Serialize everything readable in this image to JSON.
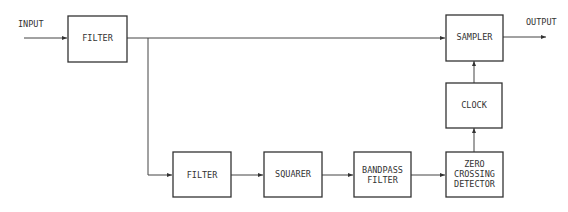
{
  "diagram": {
    "input_label": "INPUT",
    "output_label": "OUTPUT",
    "blocks": {
      "filter1": {
        "lines": [
          "FILTER"
        ]
      },
      "sampler": {
        "lines": [
          "SAMPLER"
        ]
      },
      "clock": {
        "lines": [
          "CLOCK"
        ]
      },
      "filter2": {
        "lines": [
          "FILTER"
        ]
      },
      "squarer": {
        "lines": [
          "SQUARER"
        ]
      },
      "bandpass": {
        "lines": [
          "BANDPASS",
          "FILTER"
        ]
      },
      "zcd": {
        "lines": [
          "ZERO",
          "CROSSING",
          "DETECTOR"
        ]
      }
    },
    "connections": [
      {
        "from": "input",
        "to": "filter1"
      },
      {
        "from": "filter1",
        "to": "sampler"
      },
      {
        "from": "filter1",
        "to": "filter2"
      },
      {
        "from": "filter2",
        "to": "squarer"
      },
      {
        "from": "squarer",
        "to": "bandpass"
      },
      {
        "from": "bandpass",
        "to": "zcd"
      },
      {
        "from": "zcd",
        "to": "clock"
      },
      {
        "from": "clock",
        "to": "sampler"
      },
      {
        "from": "sampler",
        "to": "output"
      }
    ]
  }
}
